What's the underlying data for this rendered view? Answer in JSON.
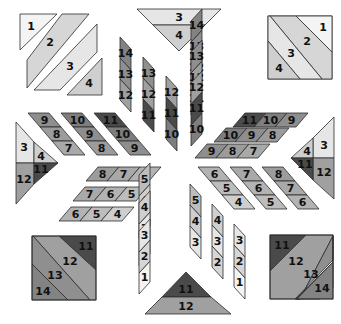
{
  "diagram": {
    "width": 341,
    "height": 324,
    "shades": {
      "1": "#f4f4f4",
      "2": "#d6d6d6",
      "3": "#e6e6e6",
      "4": "#cfcfcf",
      "5": "#bdbdbd",
      "6": "#b3b3b3",
      "7": "#a9a9a9",
      "8": "#9c9c9c",
      "9": "#8e8e8e",
      "10": "#7e7e7e",
      "11": "#4a4a4a",
      "12": "#a0a0a0",
      "13": "#8f8f8f",
      "14": "#838383"
    },
    "corner_squares": [
      {
        "id": "top-left",
        "labels": [
          "1",
          "2",
          "3",
          "4"
        ]
      },
      {
        "id": "top-right",
        "labels": [
          "1",
          "2",
          "3",
          "4"
        ]
      },
      {
        "id": "bottom-left",
        "labels": [
          "11",
          "12",
          "13",
          "14"
        ]
      },
      {
        "id": "bottom-right",
        "labels": [
          "11",
          "12",
          "13",
          "14"
        ]
      }
    ],
    "side_triangles": [
      {
        "id": "top",
        "labels": [
          "3",
          "4"
        ]
      },
      {
        "id": "bottom",
        "labels": [
          "11",
          "12"
        ]
      },
      {
        "id": "left",
        "labels": [
          "3",
          "4",
          "12",
          "11"
        ]
      },
      {
        "id": "right",
        "labels": [
          "3",
          "4",
          "12",
          "11"
        ]
      }
    ],
    "strips": {
      "top_left": [
        [
          "14",
          "13",
          "12"
        ],
        [
          "13",
          "12",
          "11"
        ],
        [
          "12",
          "11",
          "10"
        ]
      ],
      "top_right": [
        [
          "12",
          "13",
          "14"
        ],
        [
          "11",
          "12",
          "13"
        ],
        [
          "10",
          "11",
          "12"
        ]
      ],
      "left_upper": [
        [
          "9",
          "8",
          "7"
        ],
        [
          "10",
          "9",
          "8"
        ],
        [
          "11",
          "10",
          "9"
        ]
      ],
      "right_upper": [
        [
          "11",
          "10",
          "9"
        ],
        [
          "10",
          "9",
          "8"
        ],
        [
          "9",
          "8",
          "7"
        ]
      ],
      "left_lower": [
        [
          "8",
          "7",
          "6"
        ],
        [
          "7",
          "6",
          "5"
        ],
        [
          "6",
          "5",
          "4"
        ]
      ],
      "right_lower": [
        [
          "6",
          "5",
          "4"
        ],
        [
          "7",
          "6",
          "5"
        ],
        [
          "8",
          "7",
          "6"
        ]
      ],
      "bottom_left": [
        [
          "3",
          "4",
          "5"
        ],
        [
          "2",
          "3",
          "4"
        ],
        [
          "1",
          "2",
          "3"
        ]
      ],
      "bottom_right": [
        [
          "5",
          "4",
          "3"
        ],
        [
          "4",
          "3",
          "2"
        ],
        [
          "3",
          "2",
          "1"
        ]
      ]
    }
  }
}
